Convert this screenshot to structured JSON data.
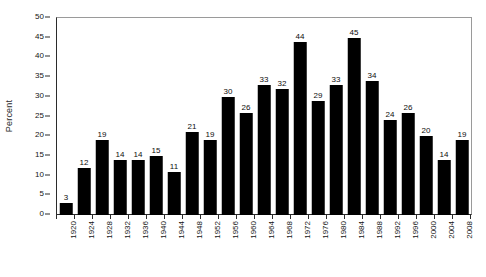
{
  "chart_data": {
    "type": "bar",
    "title": "",
    "xlabel": "",
    "ylabel": "Percent",
    "ylim": [
      0,
      50
    ],
    "ytick_step": 5,
    "yticks": [
      0,
      5,
      10,
      15,
      20,
      25,
      30,
      35,
      40,
      45,
      50
    ],
    "grid": false,
    "legend": "none",
    "bar_color": "#000000",
    "show_value_labels": true,
    "categories": [
      "1920",
      "1924",
      "1928",
      "1932",
      "1936",
      "1940",
      "1944",
      "1948",
      "1952",
      "1956",
      "1960",
      "1964",
      "1968",
      "1972",
      "1976",
      "1980",
      "1984",
      "1988",
      "1992",
      "1996",
      "2000",
      "2004",
      "2008"
    ],
    "values": [
      3,
      12,
      19,
      14,
      14,
      15,
      11,
      21,
      19,
      30,
      26,
      33,
      32,
      44,
      29,
      33,
      45,
      34,
      24,
      26,
      20,
      14,
      19
    ]
  }
}
